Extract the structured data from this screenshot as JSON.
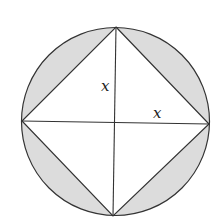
{
  "diagram": {
    "labels": {
      "vertical_half_diagonal": "x",
      "horizontal_half_diagonal": "x"
    },
    "colors": {
      "shade": "#dcdcdc",
      "stroke": "#333333",
      "background": "#ffffff"
    }
  }
}
